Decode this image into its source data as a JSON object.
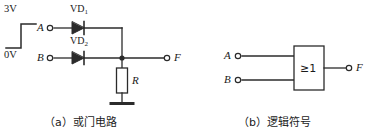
{
  "figure": {
    "panels": [
      {
        "id": "a",
        "caption": "（a）或门电路",
        "source": {
          "high_label": "3V",
          "low_label": "0V",
          "waveform": "rising-step"
        },
        "terminals": {
          "input_a": "A",
          "input_b": "B",
          "output_f": "F"
        },
        "components": {
          "diode1": "VD",
          "diode1_sub": "1",
          "diode2": "VD",
          "diode2_sub": "2",
          "resistor": "R"
        }
      },
      {
        "id": "b",
        "caption": "（b）逻辑符号",
        "terminals": {
          "input_a": "A",
          "input_b": "B",
          "output_f": "F"
        },
        "gate": {
          "symbol": "≥1",
          "type": "OR"
        }
      }
    ],
    "colors": {
      "line": "#2b2b2b",
      "text": "#1a1a1a",
      "background": "#ffffff"
    }
  }
}
